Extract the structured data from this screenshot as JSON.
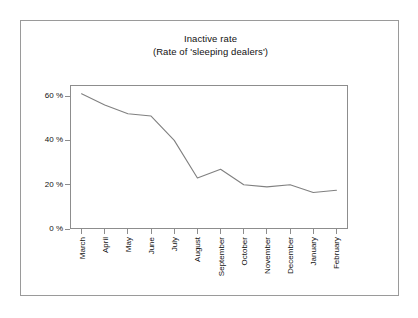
{
  "figure": {
    "title_line1": "Inactive rate",
    "title_line2": "(Rate of 'sleeping dealers')"
  },
  "chart_data": {
    "type": "line",
    "title": "Inactive rate (Rate of 'sleeping dealers')",
    "title_lines": [
      "Inactive rate",
      "(Rate of 'sleeping dealers')"
    ],
    "xlabel": "",
    "ylabel": "",
    "categories": [
      "March",
      "April",
      "May",
      "June",
      "July",
      "August",
      "September",
      "October",
      "November",
      "December",
      "January",
      "February"
    ],
    "values": [
      61,
      56,
      52,
      51,
      40,
      23,
      27,
      20,
      19,
      20,
      16.5,
      17.5
    ],
    "series": [
      {
        "name": "Inactive rate",
        "values": [
          61,
          56,
          52,
          51,
          40,
          23,
          27,
          20,
          19,
          20,
          16.5,
          17.5
        ],
        "color": "#808080"
      }
    ],
    "ylim": [
      0,
      65
    ],
    "y_ticks": [
      0,
      20,
      40,
      60
    ],
    "y_tick_labels": [
      "0 %",
      "20 %",
      "40 %",
      "60 %"
    ],
    "x_tick_labels": [
      "March",
      "April",
      "May",
      "June",
      "July",
      "August",
      "September",
      "October",
      "November",
      "December",
      "January",
      "February"
    ],
    "x_tick_label_rotation": 90,
    "grid": false,
    "legend": false,
    "legend_position": "none",
    "units": "percent"
  }
}
